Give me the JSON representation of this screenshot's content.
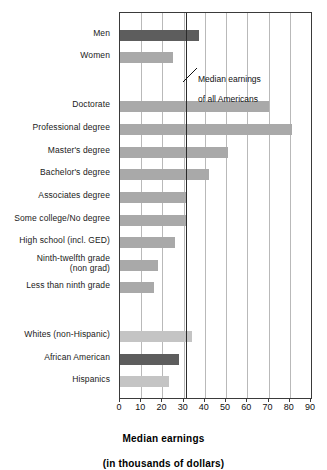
{
  "chart_data": {
    "type": "bar",
    "orientation": "horizontal",
    "title": "",
    "xlabel": "Median earnings\n(in thousands of dollars)",
    "xlabel_line1": "Median earnings",
    "xlabel_line2": "(in thousands of dollars)",
    "ylabel": "",
    "xlim": [
      0,
      90
    ],
    "xticks": [
      0,
      10,
      20,
      30,
      40,
      50,
      60,
      70,
      80,
      90
    ],
    "xtick_labels": [
      "0",
      "10",
      "20",
      "30",
      "40",
      "50",
      "60",
      "70",
      "80",
      "90"
    ],
    "grid": "vertical",
    "legend": "none",
    "groups": [
      {
        "name": "gender",
        "categories": [
          "Men",
          "Women"
        ],
        "values": [
          37,
          25
        ]
      },
      {
        "name": "education",
        "categories": [
          "Doctorate",
          "Professional degree",
          "Master's degree",
          "Bachelor's degree",
          "Associates degree",
          "Some college/No degree",
          "High school (incl. GED)",
          "Ninth-twelfth grade\n(non grad)",
          "Less than ninth grade"
        ],
        "values": [
          70,
          81,
          51,
          42,
          31,
          31,
          26,
          18,
          16
        ]
      },
      {
        "name": "race",
        "categories": [
          "Whites (non-Hispanic)",
          "African American",
          "Hispanics"
        ],
        "values": [
          34,
          28,
          23
        ]
      }
    ],
    "bars": [
      {
        "label": "Men",
        "value": 37,
        "shade": "dark",
        "group": "gender"
      },
      {
        "label": "Women",
        "value": 25,
        "shade": "mid",
        "group": "gender"
      },
      {
        "label": "Doctorate",
        "value": 70,
        "shade": "mid",
        "group": "education"
      },
      {
        "label": "Professional degree",
        "value": 81,
        "shade": "mid",
        "group": "education"
      },
      {
        "label": "Master's degree",
        "value": 51,
        "shade": "mid",
        "group": "education"
      },
      {
        "label": "Bachelor's degree",
        "value": 42,
        "shade": "mid",
        "group": "education"
      },
      {
        "label": "Associates degree",
        "value": 31,
        "shade": "mid",
        "group": "education"
      },
      {
        "label": "Some college/No degree",
        "value": 31,
        "shade": "mid",
        "group": "education"
      },
      {
        "label": "High school (incl. GED)",
        "value": 26,
        "shade": "mid",
        "group": "education"
      },
      {
        "label": "Ninth-twelfth grade\n(non grad)",
        "value": 18,
        "shade": "mid",
        "group": "education"
      },
      {
        "label": "Less than ninth grade",
        "value": 16,
        "shade": "mid",
        "group": "education"
      },
      {
        "label": "Whites (non-Hispanic)",
        "value": 34,
        "shade": "light",
        "group": "race"
      },
      {
        "label": "African American",
        "value": 28,
        "shade": "dark",
        "group": "race"
      },
      {
        "label": "Hispanics",
        "value": 23,
        "shade": "light",
        "group": "race"
      }
    ],
    "reference_line": {
      "value": 31,
      "annotation": "Median earnings\nof all Americans",
      "annotation_line1": "Median earnings",
      "annotation_line2": "of all Americans"
    },
    "colors": {
      "dark": "#5d5d5d",
      "mid": "#a9a9a9",
      "light": "#c4c4c4",
      "gridline": "#b9b9b9",
      "axis": "#3a3a3a",
      "reference_line": "#2b2b2b",
      "background": "#ffffff",
      "text": "#111111"
    }
  }
}
